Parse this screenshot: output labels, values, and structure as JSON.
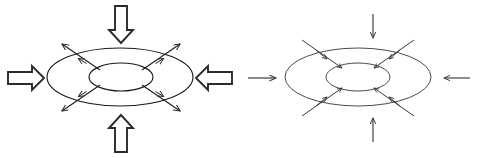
{
  "figure": {
    "title_stub": "",
    "background_color": "#ffffff",
    "stroke_color": "#1a1a1a",
    "block_arrow_fill": "#ffffff",
    "block_arrow_stroke": "#2b2b2b",
    "thin_arrow_color": "#3a3a3a",
    "width": 477,
    "height": 158,
    "panels": [
      {
        "id": "left-panel",
        "name": "expansion-torus-diagram",
        "arrow_style": "block-outline",
        "flow_direction": "outward",
        "outer_ellipse": {
          "cx": 120,
          "cy": 77,
          "rx": 73,
          "ry": 29
        },
        "inner_ellipse": {
          "cx": 121,
          "cy": 77,
          "rx": 32,
          "ry": 14
        },
        "block_arrows": [
          {
            "name": "block-arrow-left-inward",
            "direction": "right",
            "x": 8,
            "y": 68
          },
          {
            "name": "block-arrow-top-inward",
            "direction": "down",
            "x": 110,
            "y": 6
          },
          {
            "name": "block-arrow-right-inward",
            "direction": "left",
            "x": 206,
            "y": 68
          },
          {
            "name": "block-arrow-bottom-inward",
            "direction": "up",
            "x": 110,
            "y": 116
          }
        ],
        "radial_arrows": [
          {
            "name": "radial-arrow-upper-left",
            "angle_deg": 215
          },
          {
            "name": "radial-arrow-upper-right",
            "angle_deg": 325
          },
          {
            "name": "radial-arrow-lower-left",
            "angle_deg": 145
          },
          {
            "name": "radial-arrow-lower-right",
            "angle_deg": 35
          }
        ]
      },
      {
        "id": "transition-arrow",
        "name": "transition-arrow-right",
        "direction": "right",
        "x": 248,
        "y": 70
      },
      {
        "id": "right-panel",
        "name": "compression-torus-diagram",
        "arrow_style": "thin-line",
        "flow_direction": "inward",
        "outer_ellipse": {
          "cx": 358,
          "cy": 77,
          "rx": 73,
          "ry": 29
        },
        "inner_ellipse": {
          "cx": 358,
          "cy": 77,
          "rx": 32,
          "ry": 14
        },
        "thin_arrows": [
          {
            "name": "thin-arrow-left-inward",
            "direction": "right",
            "x": 258,
            "y": 77
          },
          {
            "name": "thin-arrow-top-inward",
            "direction": "down",
            "x": 373,
            "y": 14
          },
          {
            "name": "thin-arrow-right-inward",
            "direction": "left",
            "x": 442,
            "y": 77
          },
          {
            "name": "thin-arrow-bottom-inward",
            "direction": "up",
            "x": 373,
            "y": 140
          }
        ],
        "radial_arrows": [
          {
            "name": "radial-arrow-upper-left",
            "angle_deg": 215
          },
          {
            "name": "radial-arrow-upper-right",
            "angle_deg": 325
          },
          {
            "name": "radial-arrow-lower-left",
            "angle_deg": 145
          },
          {
            "name": "radial-arrow-lower-right",
            "angle_deg": 35
          }
        ]
      }
    ]
  }
}
